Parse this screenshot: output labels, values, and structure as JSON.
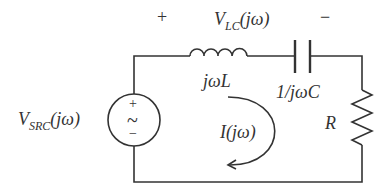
{
  "labels": {
    "plus": "+",
    "minus": "−",
    "vlc_main": "V",
    "vlc_sub": "LC",
    "vlc_arg": "(jω)",
    "inductor": "jωL",
    "capacitor": "1/jωC",
    "resistor": "R",
    "current": "I(jω)",
    "vsrc_main": "V",
    "vsrc_sub": "SRC",
    "vsrc_arg": "(jω)",
    "src_plus": "+",
    "src_tilde": "~",
    "src_minus": "−"
  },
  "colors": {
    "stroke": "#333333",
    "background": "#ffffff"
  }
}
